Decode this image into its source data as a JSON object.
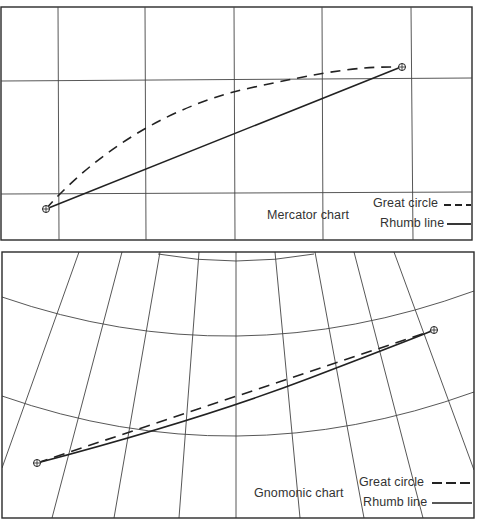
{
  "mercator": {
    "title": "Mercator chart",
    "legend": [
      {
        "label": "Great circle",
        "style": "dashed"
      },
      {
        "label": "Rhumb line",
        "style": "solid"
      }
    ],
    "grid": {
      "meridians_x": [
        58,
        145,
        235,
        322,
        412
      ],
      "parallels_y": [
        80,
        193
      ]
    },
    "start_point": {
      "x": 46,
      "y": 209,
      "symbol": "circled-plus"
    },
    "end_point": {
      "x": 401,
      "y": 67,
      "symbol": "circled-plus"
    }
  },
  "gnomonic": {
    "title": "Gnomonic chart",
    "legend": [
      {
        "label": "Great circle",
        "style": "dashed"
      },
      {
        "label": "Rhumb line",
        "style": "solid"
      }
    ],
    "start_point": {
      "x": 37,
      "y": 463,
      "symbol": "circled-plus"
    },
    "end_point": {
      "x": 434,
      "y": 330,
      "symbol": "circled-plus"
    }
  },
  "colors": {
    "line": "#2a2a2a",
    "grid": "#444444",
    "background": "#ffffff"
  }
}
